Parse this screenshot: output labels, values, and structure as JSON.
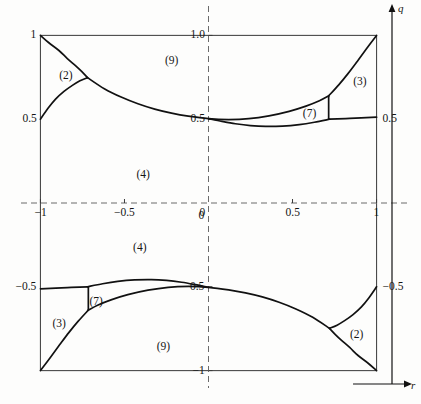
{
  "figure": {
    "title": "",
    "axis_names": {
      "x": "r",
      "y": "q"
    },
    "frame": {
      "left": -1.08,
      "right": 1.08,
      "bottom": -1.08,
      "top": 1.08
    }
  },
  "chart_data": {
    "type": "line",
    "title": "",
    "xlabel": "r",
    "ylabel": "q",
    "xlim": [
      -1.08,
      1.08
    ],
    "ylim": [
      -1.08,
      1.08
    ],
    "grid": false,
    "axes_style": "dashed-crosshair-through-origin",
    "x_ticks": [
      -1,
      -0.5,
      0,
      0.5,
      1
    ],
    "x_tick_labels": [
      "−1",
      "−0.5",
      "0",
      "0.5",
      "1"
    ],
    "y_ticks": [
      1.0,
      0.5,
      0,
      -0.5,
      -1
    ],
    "y_tick_labels": [
      "1.0",
      "0.5",
      "0",
      "−0.5",
      "−1"
    ],
    "left_edge_labels": [
      {
        "value": 1.0,
        "text": "1"
      },
      {
        "value": 0.5,
        "text": "0.5"
      },
      {
        "value": -0.5,
        "text": "−0.5"
      }
    ],
    "right_edge_labels": [
      {
        "value": 0.5,
        "text": "0.5"
      },
      {
        "value": -0.5,
        "text": "−0.5"
      }
    ],
    "regions": [
      {
        "label": "(2)",
        "x": -0.85,
        "y": 0.76
      },
      {
        "label": "(9)",
        "x": -0.22,
        "y": 0.85
      },
      {
        "label": "(3)",
        "x": 0.9,
        "y": 0.72
      },
      {
        "label": "(7)",
        "x": 0.6,
        "y": 0.53
      },
      {
        "label": "(4)",
        "x": -0.39,
        "y": 0.17
      },
      {
        "label": "(4)",
        "x": -0.41,
        "y": -0.27
      },
      {
        "label": "(7)",
        "x": -0.67,
        "y": -0.59
      },
      {
        "label": "(3)",
        "x": -0.89,
        "y": -0.72
      },
      {
        "label": "(9)",
        "x": -0.27,
        "y": -0.86
      },
      {
        "label": "(2)",
        "x": 0.88,
        "y": -0.79
      }
    ],
    "curves": [
      {
        "name": "upper-left-descending-branch",
        "comment": "from (-1,1) corner down-right to triple point near (-0.72,0.73)",
        "points": [
          [
            -1.0,
            1.0
          ],
          [
            -0.95,
            0.956
          ],
          [
            -0.89,
            0.91
          ],
          [
            -0.84,
            0.862
          ],
          [
            -0.79,
            0.818
          ],
          [
            -0.755,
            0.785
          ],
          [
            -0.72,
            0.748
          ]
        ]
      },
      {
        "name": "upper-left-ascending-branch",
        "comment": "from left edge (-1,0.5) rising to triple point near (-0.72,0.73)",
        "points": [
          [
            -1.0,
            0.5
          ],
          [
            -0.955,
            0.565
          ],
          [
            -0.91,
            0.62
          ],
          [
            -0.86,
            0.666
          ],
          [
            -0.81,
            0.702
          ],
          [
            -0.765,
            0.729
          ],
          [
            -0.72,
            0.748
          ]
        ]
      },
      {
        "name": "upper-main-catenary",
        "comment": "from triple point (-0.72,0.73) sweeping right through (0,0.5) to the (7)/(3) junction near (0.72,0.5)",
        "points": [
          [
            -0.72,
            0.748
          ],
          [
            -0.62,
            0.682
          ],
          [
            -0.52,
            0.632
          ],
          [
            -0.42,
            0.592
          ],
          [
            -0.32,
            0.56
          ],
          [
            -0.22,
            0.536
          ],
          [
            -0.12,
            0.518
          ],
          [
            0.0,
            0.503
          ],
          [
            0.12,
            0.498
          ],
          [
            0.24,
            0.503
          ],
          [
            0.36,
            0.52
          ],
          [
            0.48,
            0.547
          ],
          [
            0.58,
            0.578
          ],
          [
            0.66,
            0.61
          ],
          [
            0.715,
            0.639
          ]
        ]
      },
      {
        "name": "upper-inner-curve",
        "comment": "lower boundary of region (7): from (0,0.5) dipping to about (0.33,0.455) then rising to (0.72,0.5)",
        "points": [
          [
            0.0,
            0.503
          ],
          [
            0.08,
            0.487
          ],
          [
            0.16,
            0.473
          ],
          [
            0.25,
            0.462
          ],
          [
            0.34,
            0.457
          ],
          [
            0.44,
            0.459
          ],
          [
            0.54,
            0.468
          ],
          [
            0.63,
            0.482
          ],
          [
            0.72,
            0.5
          ]
        ]
      },
      {
        "name": "upper-right-vertical",
        "comment": "short vertical wall between region (7) and region (3) at r approx 0.715",
        "points": [
          [
            0.715,
            0.639
          ],
          [
            0.715,
            0.5
          ]
        ]
      },
      {
        "name": "upper-right-rising-to-corner",
        "comment": "from the (7)/(3) top junction up to the (1,1) corner",
        "points": [
          [
            0.715,
            0.639
          ],
          [
            0.775,
            0.705
          ],
          [
            0.83,
            0.772
          ],
          [
            0.885,
            0.845
          ],
          [
            0.94,
            0.92
          ],
          [
            1.0,
            1.0
          ]
        ]
      },
      {
        "name": "upper-right-edge-segment",
        "comment": "from (0.72,0.5) out to the right edge at (1,0.5)",
        "points": [
          [
            0.72,
            0.5
          ],
          [
            0.84,
            0.505
          ],
          [
            1.0,
            0.512
          ]
        ]
      },
      {
        "name": "lower-right-ascending-branch",
        "comment": "mirror: from (1,-1) corner up-left to triple point near (0.72,-0.73)",
        "points": [
          [
            1.0,
            -1.0
          ],
          [
            0.95,
            -0.956
          ],
          [
            0.89,
            -0.91
          ],
          [
            0.84,
            -0.862
          ],
          [
            0.79,
            -0.818
          ],
          [
            0.755,
            -0.785
          ],
          [
            0.72,
            -0.748
          ]
        ]
      },
      {
        "name": "lower-right-descending-branch",
        "comment": "mirror: from right edge (1,-0.5) down to triple point near (0.72,-0.73)",
        "points": [
          [
            1.0,
            -0.5
          ],
          [
            0.955,
            -0.565
          ],
          [
            0.91,
            -0.62
          ],
          [
            0.86,
            -0.666
          ],
          [
            0.81,
            -0.702
          ],
          [
            0.765,
            -0.729
          ],
          [
            0.72,
            -0.748
          ]
        ]
      },
      {
        "name": "lower-main-catenary",
        "comment": "mirror of the upper main curve, through (0,-0.5)",
        "points": [
          [
            0.72,
            -0.748
          ],
          [
            0.62,
            -0.682
          ],
          [
            0.52,
            -0.632
          ],
          [
            0.42,
            -0.592
          ],
          [
            0.32,
            -0.56
          ],
          [
            0.22,
            -0.536
          ],
          [
            0.12,
            -0.518
          ],
          [
            0.0,
            -0.503
          ],
          [
            -0.12,
            -0.498
          ],
          [
            -0.24,
            -0.503
          ],
          [
            -0.36,
            -0.52
          ],
          [
            -0.48,
            -0.547
          ],
          [
            -0.58,
            -0.578
          ],
          [
            -0.66,
            -0.61
          ],
          [
            -0.715,
            -0.639
          ]
        ]
      },
      {
        "name": "lower-inner-curve",
        "comment": "upper boundary of lower region (7)",
        "points": [
          [
            0.0,
            -0.503
          ],
          [
            -0.08,
            -0.487
          ],
          [
            -0.16,
            -0.473
          ],
          [
            -0.25,
            -0.462
          ],
          [
            -0.34,
            -0.457
          ],
          [
            -0.44,
            -0.459
          ],
          [
            -0.54,
            -0.468
          ],
          [
            -0.63,
            -0.482
          ],
          [
            -0.72,
            -0.5
          ]
        ]
      },
      {
        "name": "lower-left-vertical",
        "comment": "short vertical wall between lower (7) and lower (3) at r approx -0.715",
        "points": [
          [
            -0.715,
            -0.639
          ],
          [
            -0.715,
            -0.5
          ]
        ]
      },
      {
        "name": "lower-left-falling-to-corner",
        "comment": "from the lower (7)/(3) junction down to the (-1,-1) corner",
        "points": [
          [
            -0.715,
            -0.639
          ],
          [
            -0.775,
            -0.705
          ],
          [
            -0.83,
            -0.772
          ],
          [
            -0.885,
            -0.845
          ],
          [
            -0.94,
            -0.92
          ],
          [
            -1.0,
            -1.0
          ]
        ]
      },
      {
        "name": "lower-left-edge-segment",
        "comment": "from (-0.72,-0.5) out to the left edge at (-1,-0.5)",
        "points": [
          [
            -0.72,
            -0.5
          ],
          [
            -0.84,
            -0.505
          ],
          [
            -1.0,
            -0.512
          ]
        ]
      }
    ]
  },
  "style": {
    "curve_color": "#111111",
    "frame_color": "#4a4a4a",
    "axis_dash_color": "#6a6a6a",
    "background": "#fdfdfc"
  }
}
